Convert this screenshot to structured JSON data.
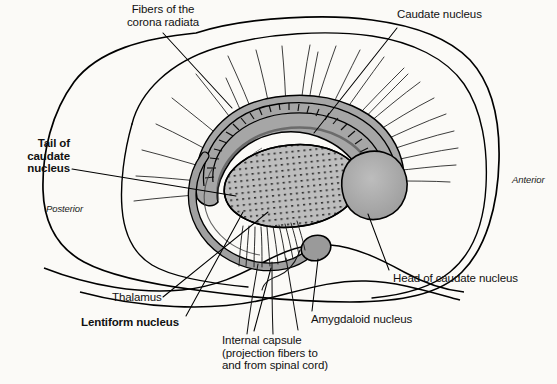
{
  "figure": {
    "background_color": "#fbfaf7",
    "line_color": "#000000"
  },
  "orientation": {
    "posterior": "Posterior",
    "anterior": "Anterior"
  },
  "labels": {
    "corona_radiata": "Fibers of the\ncorona radiata",
    "caudate_nucleus": "Caudate nucleus",
    "tail_of_caudate": "Tail of\ncaudate\nnucleus",
    "head_of_caudate": "Head of caudate nucleus",
    "thalamus": "Thalamus",
    "lentiform_nucleus": "Lentiform nucleus",
    "amygdaloid_nucleus": "Amygdaloid nucleus",
    "internal_capsule": "Internal capsule\n(projection fibers to\nand from spinal cord)"
  },
  "structures": {
    "lentiform_fill": "#9e9e9e",
    "thalamus_fill": "#b5b5b5",
    "caudate_head_fill": "#a8a8a8",
    "caudate_tail_fill": "#9a9a9a",
    "amygdala_fill": "#8f8f8f"
  }
}
